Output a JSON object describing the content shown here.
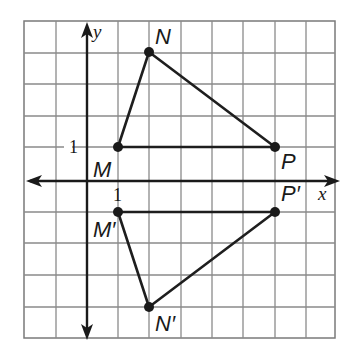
{
  "figure": {
    "type": "coordinate-plane-reflection",
    "grid": {
      "x_range": [
        -2,
        8
      ],
      "y_range": [
        -5,
        5
      ],
      "unit": 1
    },
    "axes": {
      "x_label": "x",
      "y_label": "y",
      "x_tick_label": "1",
      "y_tick_label": "1"
    },
    "triangles": [
      {
        "name": "MNP",
        "vertices": [
          {
            "label": "M",
            "x": 1,
            "y": 1
          },
          {
            "label": "N",
            "x": 2,
            "y": 4
          },
          {
            "label": "P",
            "x": 6,
            "y": 1
          }
        ]
      },
      {
        "name": "M'N'P'",
        "vertices": [
          {
            "label": "M′",
            "x": 1,
            "y": -1
          },
          {
            "label": "N′",
            "x": 2,
            "y": -4
          },
          {
            "label": "P′",
            "x": 6,
            "y": -1
          }
        ]
      }
    ],
    "colors": {
      "grid": "#8a8a8a",
      "ink": "#1a1a1a",
      "background": "#ffffff"
    }
  }
}
